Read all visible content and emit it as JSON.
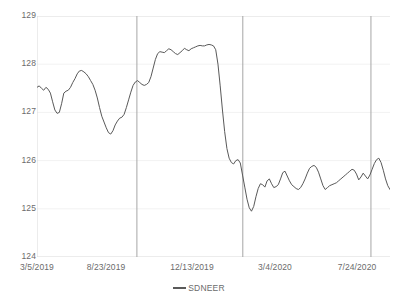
{
  "chart_data": {
    "type": "line",
    "title": "",
    "xlabel": "",
    "ylabel": "",
    "ylim": [
      124,
      129
    ],
    "ytick_labels": [
      "129",
      "128",
      "127",
      "126",
      "125",
      "124"
    ],
    "ytick_values": [
      129,
      128,
      127,
      126,
      125,
      124
    ],
    "grid": true,
    "legend_position": "bottom",
    "xtick_labels": [
      "3/5/2019",
      "8/23/2019",
      "12/13/2019",
      "3/4/2020",
      "7/24/2020"
    ],
    "xtick_fractions": [
      0.0,
      0.245,
      0.49,
      0.735,
      0.98
    ],
    "series": [
      {
        "name": "SDNEER",
        "color": "#595959",
        "values": [
          127.52,
          127.55,
          127.5,
          127.46,
          127.52,
          127.48,
          127.4,
          127.22,
          127.05,
          126.98,
          127.0,
          127.18,
          127.4,
          127.44,
          127.46,
          127.52,
          127.62,
          127.7,
          127.8,
          127.86,
          127.87,
          127.84,
          127.8,
          127.74,
          127.66,
          127.58,
          127.46,
          127.3,
          127.1,
          126.92,
          126.8,
          126.68,
          126.58,
          126.55,
          126.62,
          126.74,
          126.82,
          126.88,
          126.9,
          126.96,
          127.1,
          127.26,
          127.42,
          127.56,
          127.63,
          127.66,
          127.62,
          127.58,
          127.56,
          127.58,
          127.62,
          127.74,
          127.92,
          128.1,
          128.22,
          128.26,
          128.25,
          128.24,
          128.28,
          128.32,
          128.3,
          128.26,
          128.22,
          128.2,
          128.24,
          128.28,
          128.33,
          128.3,
          128.28,
          128.32,
          128.34,
          128.36,
          128.38,
          128.39,
          128.38,
          128.38,
          128.4,
          128.41,
          128.4,
          128.38,
          128.3,
          128.0,
          127.55,
          127.05,
          126.6,
          126.25,
          126.05,
          125.96,
          125.93,
          126.0,
          126.02,
          125.95,
          125.7,
          125.45,
          125.2,
          125.02,
          124.95,
          125.05,
          125.25,
          125.42,
          125.52,
          125.5,
          125.45,
          125.58,
          125.62,
          125.52,
          125.44,
          125.46,
          125.5,
          125.62,
          125.75,
          125.78,
          125.68,
          125.58,
          125.5,
          125.46,
          125.42,
          125.4,
          125.44,
          125.52,
          125.62,
          125.74,
          125.84,
          125.88,
          125.9,
          125.86,
          125.76,
          125.62,
          125.48,
          125.4,
          125.44,
          125.48,
          125.5,
          125.52,
          125.54,
          125.58,
          125.62,
          125.66,
          125.7,
          125.74,
          125.78,
          125.82,
          125.8,
          125.72,
          125.6,
          125.66,
          125.74,
          125.68,
          125.62,
          125.7,
          125.82,
          125.94,
          126.02,
          126.05,
          125.96,
          125.8,
          125.62,
          125.48,
          125.4
        ]
      }
    ],
    "reference_lines": [
      {
        "name": "ref-line-1",
        "x_fraction": 0.283,
        "color": "#a6a6a6"
      },
      {
        "name": "ref-line-2",
        "x_fraction": 0.583,
        "color": "#a6a6a6"
      },
      {
        "name": "ref-line-3",
        "x_fraction": 0.946,
        "color": "#a6a6a6"
      }
    ],
    "gridline_color": "#f2f2f2",
    "axis_color": "#d9d9d9"
  },
  "legend": {
    "label": "SDNEER",
    "swatch_color": "#5a5a5a"
  }
}
